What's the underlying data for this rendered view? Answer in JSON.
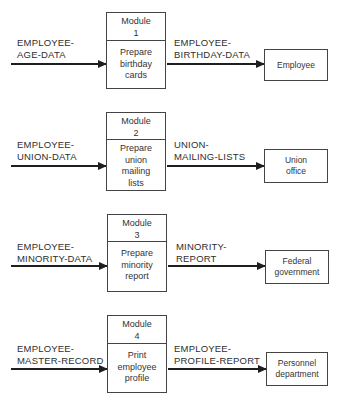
{
  "diagram": {
    "type": "data-flow",
    "rows": [
      {
        "module": {
          "title": "Module",
          "number": "1",
          "process": [
            "Prepare",
            "birthday",
            "cards"
          ]
        },
        "input": [
          "EMPLOYEE-",
          "AGE-DATA"
        ],
        "output": [
          "EMPLOYEE-",
          "BIRTHDAY-DATA"
        ],
        "destination": [
          "Employee"
        ]
      },
      {
        "module": {
          "title": "Module",
          "number": "2",
          "process": [
            "Prepare",
            "union",
            "mailing",
            "lists"
          ]
        },
        "input": [
          "EMPLOYEE-",
          "UNION-DATA"
        ],
        "output": [
          "UNION-",
          "MAILING-LISTS"
        ],
        "destination": [
          "Union",
          "office"
        ]
      },
      {
        "module": {
          "title": "Module",
          "number": "3",
          "process": [
            "Prepare",
            "minority",
            "report"
          ]
        },
        "input": [
          "EMPLOYEE-",
          "MINORITY-DATA"
        ],
        "output": [
          "MINORITY-",
          "REPORT"
        ],
        "destination": [
          "Federal",
          "government"
        ]
      },
      {
        "module": {
          "title": "Module",
          "number": "4",
          "process": [
            "Print",
            "employee",
            "profile"
          ]
        },
        "input": [
          "EMPLOYEE-",
          "MASTER-RECORD"
        ],
        "output": [
          "EMPLOYEE-",
          "PROFILE-REPORT"
        ],
        "destination": [
          "Personnel",
          "department"
        ]
      }
    ]
  }
}
